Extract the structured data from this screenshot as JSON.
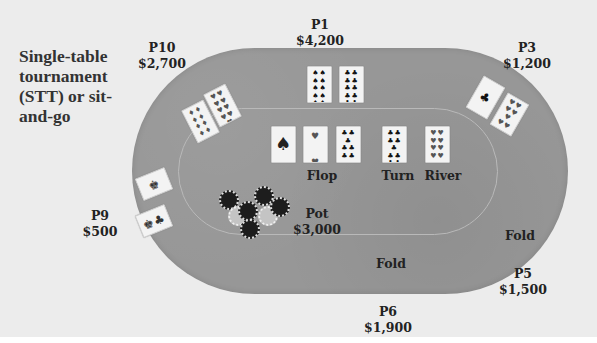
{
  "caption": "Single-table tournament (STT) or sit-and-go",
  "players": [
    {
      "id": "P1",
      "stack": "$4,200",
      "status": "active"
    },
    {
      "id": "P3",
      "stack": "$1,200",
      "status": "active"
    },
    {
      "id": "P5",
      "stack": "$1,500",
      "status": "Fold"
    },
    {
      "id": "P6",
      "stack": "$1,900",
      "status": "Fold"
    },
    {
      "id": "P9",
      "stack": "$500",
      "status": "active"
    },
    {
      "id": "P10",
      "stack": "$2,700",
      "status": "active"
    }
  ],
  "board": {
    "flop_label": "Flop",
    "turn_label": "Turn",
    "river_label": "River",
    "cards": [
      "A♠",
      "2♥",
      "7♣",
      "10♣",
      "8♥"
    ]
  },
  "hands": {
    "P1": [
      "10♠",
      "10♣"
    ],
    "P3": [
      "A♣",
      "7♥"
    ],
    "P9": [
      "K",
      "K♣"
    ],
    "P10": [
      "8♦",
      "9♥"
    ]
  },
  "pot": {
    "label": "Pot",
    "amount": "$3,000"
  },
  "fold_label": "Fold",
  "colors": {
    "table_felt": "#979797",
    "background": "#ececec",
    "rail_line": "#b9b9b9",
    "chip_dark": "#1d1d1d",
    "chip_light": "#c4c4c4"
  }
}
